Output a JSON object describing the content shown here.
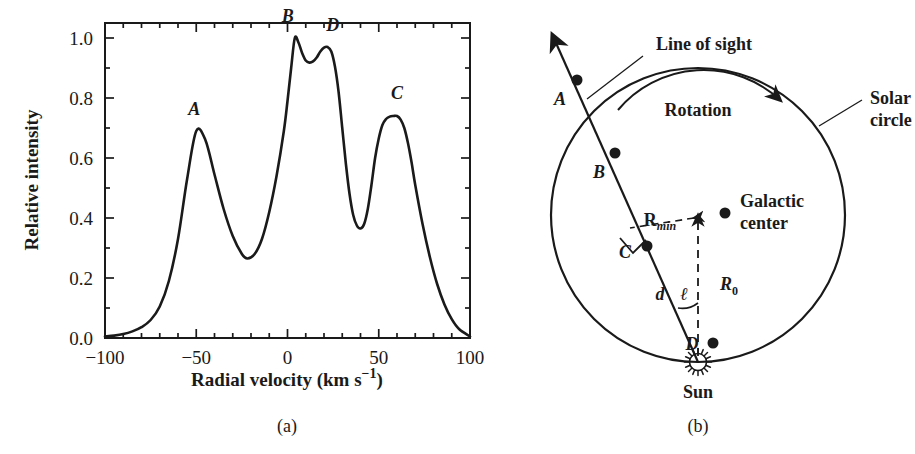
{
  "figure": {
    "panels": [
      {
        "caption": "(a)",
        "kind": "plot"
      },
      {
        "caption": "(b)",
        "kind": "diagram"
      }
    ]
  },
  "chart_data": {
    "type": "line",
    "title": "",
    "xlabel_parts": {
      "main": "Radial velocity (km s",
      "sup": "−1",
      "close": ")"
    },
    "xlabel": "Radial velocity (km s−1)",
    "ylabel": "Relative intensity",
    "xlim": [
      -100,
      100
    ],
    "ylim": [
      0.0,
      1.05
    ],
    "xticks": [
      -100,
      -50,
      0,
      50,
      100
    ],
    "xtick_labels": [
      "−100",
      "−50",
      "0",
      "50",
      "100"
    ],
    "x_minor_step": 10,
    "yticks": [
      0.0,
      0.2,
      0.4,
      0.6,
      0.8,
      1.0
    ],
    "ytick_labels": [
      "0.0",
      "0.2",
      "0.4",
      "0.6",
      "0.8",
      "1.0"
    ],
    "y_minor_step": 0.1,
    "grid": false,
    "legend": "none",
    "annotations": [
      {
        "label": "A",
        "x": -50,
        "y": 0.69
      },
      {
        "label": "B",
        "x": 4,
        "y": 1.0
      },
      {
        "label": "D",
        "x": 22,
        "y": 0.97
      },
      {
        "label": "C",
        "x": 60,
        "y": 0.74
      }
    ],
    "x": [
      -100,
      -95,
      -90,
      -85,
      -80,
      -75,
      -70,
      -65,
      -60,
      -55,
      -50,
      -45,
      -40,
      -35,
      -30,
      -25,
      -22,
      -18,
      -14,
      -10,
      -6,
      -2,
      0,
      2,
      4,
      6,
      8,
      10,
      12,
      14,
      16,
      18,
      20,
      22,
      24,
      26,
      28,
      30,
      32,
      34,
      36,
      38,
      40,
      42,
      44,
      46,
      48,
      50,
      52,
      54,
      56,
      58,
      60,
      62,
      64,
      66,
      68,
      70,
      74,
      78,
      82,
      86,
      90,
      94,
      100
    ],
    "y": [
      0.005,
      0.008,
      0.013,
      0.022,
      0.036,
      0.06,
      0.105,
      0.19,
      0.33,
      0.53,
      0.69,
      0.66,
      0.545,
      0.43,
      0.34,
      0.28,
      0.265,
      0.28,
      0.33,
      0.42,
      0.54,
      0.69,
      0.79,
      0.9,
      1.0,
      0.985,
      0.95,
      0.925,
      0.918,
      0.922,
      0.935,
      0.955,
      0.968,
      0.97,
      0.955,
      0.905,
      0.82,
      0.7,
      0.58,
      0.48,
      0.41,
      0.375,
      0.365,
      0.38,
      0.43,
      0.51,
      0.6,
      0.665,
      0.71,
      0.73,
      0.738,
      0.74,
      0.74,
      0.728,
      0.7,
      0.65,
      0.585,
      0.51,
      0.38,
      0.27,
      0.18,
      0.112,
      0.063,
      0.03,
      0.005
    ],
    "values": [
      0.005,
      0.008,
      0.013,
      0.022,
      0.036,
      0.06,
      0.105,
      0.19,
      0.33,
      0.53,
      0.69,
      0.66,
      0.545,
      0.43,
      0.34,
      0.28,
      0.265,
      0.28,
      0.33,
      0.42,
      0.54,
      0.69,
      0.79,
      0.9,
      1.0,
      0.985,
      0.95,
      0.925,
      0.918,
      0.922,
      0.935,
      0.955,
      0.968,
      0.97,
      0.955,
      0.905,
      0.82,
      0.7,
      0.58,
      0.48,
      0.41,
      0.375,
      0.365,
      0.38,
      0.43,
      0.51,
      0.6,
      0.665,
      0.71,
      0.73,
      0.738,
      0.74,
      0.74,
      0.728,
      0.7,
      0.65,
      0.585,
      0.51,
      0.38,
      0.27,
      0.18,
      0.112,
      0.063,
      0.03,
      0.005
    ],
    "peaks": [
      {
        "name": "A",
        "velocity": -50,
        "intensity": 0.69
      },
      {
        "name": "B",
        "velocity": 4,
        "intensity": 1.0
      },
      {
        "name": "D",
        "velocity": 22,
        "intensity": 0.97
      },
      {
        "name": "C",
        "velocity": 60,
        "intensity": 0.74
      }
    ],
    "valleys": [
      {
        "velocity": -22,
        "intensity": 0.265
      },
      {
        "velocity": 12,
        "intensity": 0.918
      },
      {
        "velocity": 40,
        "intensity": 0.365
      }
    ]
  },
  "diagram": {
    "labels": {
      "line_of_sight": "Line of sight",
      "rotation": "Rotation",
      "solar_circle_line1": "Solar",
      "solar_circle_line2": "circle",
      "galactic_center_line1": "Galactic",
      "galactic_center_line2": "center",
      "sun": "Sun",
      "r_min_main": "R",
      "r_min_sub": "min",
      "r_zero_main": "R",
      "r_zero_sub": "0",
      "distance_d": "d",
      "longitude_l": "ℓ"
    },
    "points": [
      {
        "label": "A",
        "description": "cloud-a-outside-solar-circle"
      },
      {
        "label": "B",
        "description": "cloud-b-on-solar-circle"
      },
      {
        "label": "C",
        "description": "cloud-c-at-tangent-point"
      },
      {
        "label": "D",
        "description": "cloud-d-near-sun"
      }
    ]
  }
}
